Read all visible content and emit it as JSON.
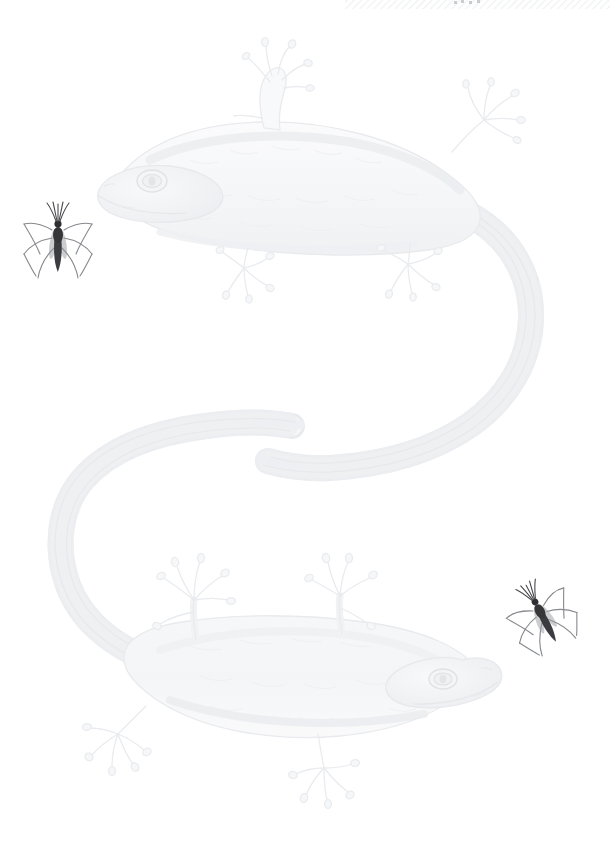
{
  "page": {
    "medium": "pencil drawing on white paper",
    "background_color": "#ffffff",
    "width": 614,
    "height": 853
  },
  "top_edge": {
    "name": "hatch-band",
    "description": "faint diagonal hatching strip at top right edge",
    "color": "#f2f3f5",
    "x": 345,
    "y": 0,
    "width": 265,
    "height": 9,
    "stripe_angle_deg": 45,
    "stripe_spacing": 5,
    "specks": [
      {
        "x": 455,
        "y": 2
      },
      {
        "x": 462,
        "y": 1
      },
      {
        "x": 470,
        "y": 2
      },
      {
        "x": 478,
        "y": 1
      }
    ],
    "speck_color": "#9a9da3"
  },
  "subjects": {
    "geckos": [
      {
        "id": "gecko-upper",
        "label": "Upper gecko",
        "orientation": "head at left, body arcing right, tail curving down",
        "outline_color": "#eceef0",
        "body_fill": "#f7f8f9",
        "shadow_color": "#e4e7ea",
        "head": {
          "x": 100,
          "y": 140,
          "width": 120,
          "height": 80
        },
        "eye": {
          "x": 152,
          "y": 178,
          "rx": 13,
          "ry": 9
        }
      },
      {
        "id": "gecko-lower",
        "label": "Lower gecko",
        "orientation": "head at right, body arcing left, tail curving up",
        "outline_color": "#eceef0",
        "body_fill": "#f7f8f9",
        "shadow_color": "#e4e7ea",
        "head": {
          "x": 400,
          "y": 640,
          "width": 110,
          "height": 70
        },
        "eye": {
          "x": 443,
          "y": 678,
          "rx": 12,
          "ry": 8
        }
      }
    ],
    "mosquitoes": [
      {
        "id": "mosquito-left",
        "label": "Mosquito upper left",
        "pose": "upright, head up, legs splayed",
        "body_color": "#3c3c40",
        "leg_color": "#77797e",
        "x": 38,
        "y": 202,
        "width": 42,
        "height": 80,
        "rotation_deg": 0
      },
      {
        "id": "mosquito-right",
        "label": "Mosquito mid right",
        "pose": "tilted, head lower right, legs splayed",
        "body_color": "#3c3c40",
        "leg_color": "#77797e",
        "x": 514,
        "y": 588,
        "width": 58,
        "height": 58,
        "rotation_deg": -28
      }
    ]
  },
  "accessibility": {
    "alt_text": "Very pale pencil drawing of two geckos arranged in an S shape on a white page, with two small dark mosquitoes, one at upper left and one at middle right."
  }
}
